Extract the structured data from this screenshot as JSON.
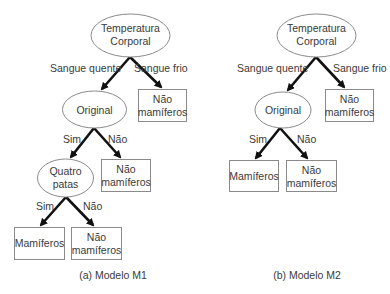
{
  "diagram_type": "decision-tree-comparison",
  "colors": {
    "edge": "#111111",
    "node_border": "#8a8a8a",
    "text": "#3a3a3a",
    "background": "#ffffff"
  },
  "model_m1": {
    "caption": "(a) Modelo M1",
    "root": {
      "line1": "Temperatura",
      "line2": "Corporal"
    },
    "edge_warm": "Sangue quente",
    "edge_cold": "Sangue frio",
    "cold_leaf": {
      "line1": "Não",
      "line2": "mamíferos"
    },
    "original": {
      "label": "Original"
    },
    "original_yes": "Sim",
    "original_no": "Não",
    "original_no_leaf": {
      "line1": "Não",
      "line2": "mamíferos"
    },
    "four_legs": {
      "line1": "Quatro",
      "line2": "patas"
    },
    "four_legs_yes": "Sim",
    "four_legs_no": "Não",
    "four_legs_yes_leaf": {
      "label": "Mamíferos"
    },
    "four_legs_no_leaf": {
      "line1": "Não",
      "line2": "mamíferos"
    }
  },
  "model_m2": {
    "caption": "(b) Modelo M2",
    "root": {
      "line1": "Temperatura",
      "line2": "Corporal"
    },
    "edge_warm": "Sangue quente",
    "edge_cold": "Sangue frio",
    "cold_leaf": {
      "line1": "Não",
      "line2": "mamíferos"
    },
    "original": {
      "label": "Original"
    },
    "original_yes": "Sim",
    "original_no": "Não",
    "original_yes_leaf": {
      "label": "Mamíferos"
    },
    "original_no_leaf": {
      "line1": "Não",
      "line2": "mamíferos"
    }
  }
}
